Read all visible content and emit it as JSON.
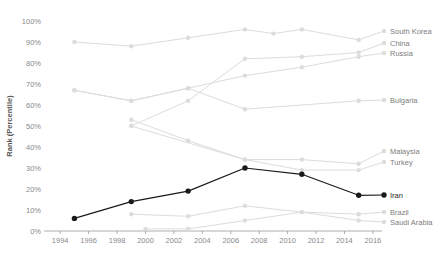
{
  "chart_data": {
    "type": "line",
    "title": "",
    "xlabel": "",
    "ylabel": "Rank (Percentile)",
    "xlim": [
      1993,
      2016.5
    ],
    "ylim": [
      0,
      100
    ],
    "grid": false,
    "legend_position": "right-inline-labels",
    "ytick_labels": [
      "0%",
      "10%",
      "20%",
      "30%",
      "40%",
      "50%",
      "60%",
      "70%",
      "80%",
      "90%",
      "100%"
    ],
    "ytick_values": [
      0,
      10,
      20,
      30,
      40,
      50,
      60,
      70,
      80,
      90,
      100
    ],
    "xtick_labels": [
      "1994",
      "1996",
      "1998",
      "2000",
      "2002",
      "2004",
      "2006",
      "2008",
      "2010",
      "2012",
      "2014",
      "2016"
    ],
    "xtick_values": [
      1994,
      1996,
      1998,
      2000,
      2002,
      2004,
      2006,
      2008,
      2010,
      2012,
      2014,
      2016
    ],
    "highlight_series": "Iran",
    "colors": {
      "highlight": "#1a1a1a",
      "muted": "#dcdcdc",
      "axis": "#9b9b9b",
      "label_text": "#7d7d7d",
      "tick_text": "#8a8a8a"
    },
    "series": [
      {
        "name": "South Korea",
        "label": "South Korea",
        "highlight": false,
        "x": [
          1995,
          1999,
          2003,
          2007,
          2009,
          2011,
          2015
        ],
        "values": [
          90,
          88,
          92,
          96,
          94,
          96,
          91
        ]
      },
      {
        "name": "China",
        "label": "China",
        "highlight": false,
        "x": [
          1999,
          2003,
          2007,
          2011,
          2015
        ],
        "values": [
          50,
          62,
          82,
          83,
          85
        ]
      },
      {
        "name": "Russia",
        "label": "Russia",
        "highlight": false,
        "x": [
          1995,
          1999,
          2003,
          2007,
          2011,
          2015
        ],
        "values": [
          67,
          62,
          68,
          74,
          78,
          83
        ]
      },
      {
        "name": "Bulgaria",
        "label": "Bulgaria",
        "highlight": false,
        "x": [
          1995,
          1999,
          2003,
          2007,
          2015
        ],
        "values": [
          67,
          62,
          68,
          58,
          62
        ]
      },
      {
        "name": "Malaysia",
        "label": "Malaysia",
        "highlight": false,
        "x": [
          1999,
          2003,
          2007,
          2011,
          2015
        ],
        "values": [
          53,
          43,
          34,
          34,
          32
        ]
      },
      {
        "name": "Turkey",
        "label": "Turkey",
        "highlight": false,
        "x": [
          1999,
          2007,
          2011,
          2015
        ],
        "values": [
          50,
          34,
          29,
          29
        ]
      },
      {
        "name": "Iran",
        "label": "Iran",
        "highlight": true,
        "x": [
          1995,
          1999,
          2003,
          2007,
          2011,
          2015
        ],
        "values": [
          6,
          14,
          19,
          30,
          27,
          17
        ]
      },
      {
        "name": "Brazil",
        "label": "Brazil",
        "highlight": false,
        "x": [
          1999,
          2003,
          2007,
          2011,
          2015
        ],
        "values": [
          8,
          7,
          12,
          9,
          8
        ]
      },
      {
        "name": "Saudi Arabia",
        "label": "Saudi Arabia",
        "highlight": false,
        "x": [
          2000,
          2003,
          2007,
          2011,
          2015
        ],
        "values": [
          1,
          1,
          5,
          9,
          5
        ]
      }
    ]
  }
}
